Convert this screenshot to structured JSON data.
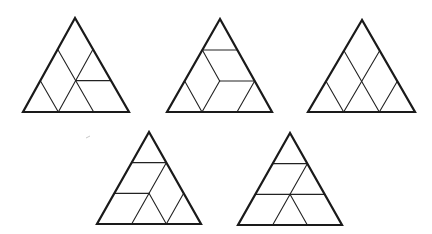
{
  "figure": {
    "grid_rows": 3,
    "colors": {
      "stroke": "#1a1a1a",
      "background": "#ffffff"
    },
    "triangles": [
      {
        "id": "triangle-1",
        "apex": [
          75,
          18
        ],
        "base_left": [
          23,
          112
        ],
        "base_right": [
          129,
          112
        ],
        "lines": [
          [
            [
              1,
              0
            ],
            [
              3,
              2
            ]
          ],
          [
            [
              1,
              1
            ],
            [
              3,
              1
            ]
          ],
          [
            [
              2,
              1
            ],
            [
              2,
              2
            ]
          ],
          [
            [
              2,
              0
            ],
            [
              3,
              1
            ]
          ]
        ]
      },
      {
        "id": "triangle-2",
        "apex": [
          220,
          19
        ],
        "base_left": [
          167,
          112
        ],
        "base_right": [
          272,
          112
        ],
        "lines": [
          [
            [
              1,
              0
            ],
            [
              1,
              1
            ]
          ],
          [
            [
              1,
              0
            ],
            [
              2,
              1
            ]
          ],
          [
            [
              2,
              1
            ],
            [
              2,
              2
            ]
          ],
          [
            [
              2,
              0
            ],
            [
              3,
              1
            ]
          ],
          [
            [
              2,
              1
            ],
            [
              3,
              1
            ]
          ],
          [
            [
              2,
              2
            ],
            [
              3,
              2
            ]
          ]
        ]
      },
      {
        "id": "triangle-3",
        "apex": [
          362,
          20
        ],
        "base_left": [
          308,
          112
        ],
        "base_right": [
          415,
          112
        ],
        "lines": [
          [
            [
              1,
              0
            ],
            [
              3,
              2
            ]
          ],
          [
            [
              1,
              1
            ],
            [
              3,
              1
            ]
          ],
          [
            [
              2,
              0
            ],
            [
              3,
              1
            ]
          ],
          [
            [
              2,
              2
            ],
            [
              3,
              2
            ]
          ]
        ]
      },
      {
        "id": "triangle-4",
        "apex": [
          149,
          132
        ],
        "base_left": [
          97,
          224
        ],
        "base_right": [
          201,
          224
        ],
        "lines": [
          [
            [
              1,
              0
            ],
            [
              1,
              1
            ]
          ],
          [
            [
              1,
              1
            ],
            [
              3,
              1
            ]
          ],
          [
            [
              2,
              0
            ],
            [
              2,
              1
            ]
          ],
          [
            [
              2,
              1
            ],
            [
              3,
              2
            ]
          ],
          [
            [
              2,
              2
            ],
            [
              3,
              2
            ]
          ]
        ]
      },
      {
        "id": "triangle-5",
        "apex": [
          290,
          133
        ],
        "base_left": [
          238,
          225
        ],
        "base_right": [
          342,
          225
        ],
        "lines": [
          [
            [
              1,
              0
            ],
            [
              1,
              1
            ]
          ],
          [
            [
              1,
              1
            ],
            [
              3,
              1
            ]
          ],
          [
            [
              2,
              0
            ],
            [
              2,
              2
            ]
          ],
          [
            [
              2,
              1
            ],
            [
              3,
              2
            ]
          ]
        ]
      }
    ],
    "artifact_mark": {
      "x1": 86,
      "y1": 138,
      "x2": 90,
      "y2": 136
    }
  }
}
